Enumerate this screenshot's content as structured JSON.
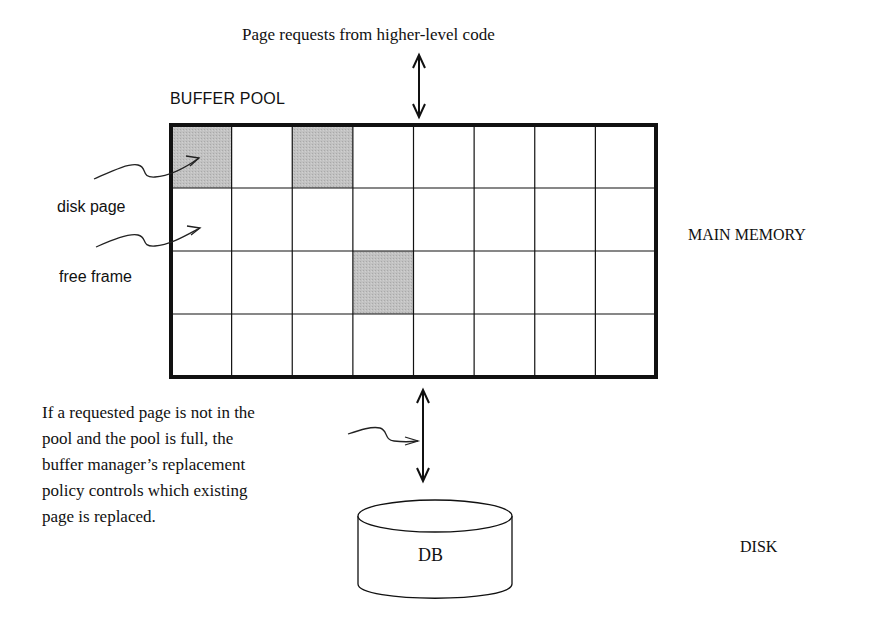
{
  "diagram": {
    "title_request": "Page requests from higher-level code",
    "buffer_pool_label": "BUFFER POOL",
    "legend": {
      "disk_page": "disk page",
      "free_frame": "free frame"
    },
    "main_memory_label": "MAIN MEMORY",
    "disk_label": "DISK",
    "db_label": "DB",
    "policy_note": [
      "If a requested page is not in the",
      "pool and the pool is full, the",
      "buffer manager’s replacement",
      "policy controls which existing",
      "page is replaced."
    ],
    "grid": {
      "rows": 4,
      "columns": 8,
      "occupied_cells": [
        [
          0,
          0
        ],
        [
          0,
          2
        ],
        [
          2,
          3
        ]
      ]
    },
    "colors": {
      "occupied_fill": "#bdbdbd",
      "line": "#111111",
      "background": "#ffffff"
    }
  }
}
